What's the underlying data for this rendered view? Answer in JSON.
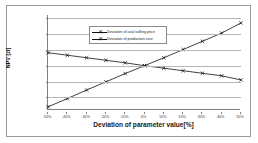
{
  "chart_data": {
    "type": "line",
    "title": "",
    "xlabel": "Deviation of parameter value[%]",
    "ylabel": "NPV [zł]",
    "x": [
      -50,
      -40,
      -30,
      -20,
      -10,
      0,
      10,
      20,
      30,
      40,
      50
    ],
    "xtick_labels": [
      "-50%",
      "-40%",
      "-30%",
      "-20%",
      "-10%",
      "0%",
      "10%",
      "20%",
      "30%",
      "40%",
      "50%"
    ],
    "ytick_labels": [
      "30 000 000",
      "25 000 000",
      "20 000 000",
      "15 000 000",
      "10 000 000",
      "5 000 000"
    ],
    "ytick_values": [
      30000000,
      25000000,
      20000000,
      15000000,
      10000000,
      5000000
    ],
    "ylim": [
      1000000,
      31000000
    ],
    "xlim": [
      -50,
      50
    ],
    "grid": "horizontal",
    "legend_position": "top-center",
    "series": [
      {
        "name": "Deviation of coal selling price",
        "marker": "x",
        "color": "#111111",
        "values": [
          2000000,
          4600000,
          7300000,
          9900000,
          12500000,
          15000000,
          17500000,
          20100000,
          22700000,
          25300000,
          28500000
        ]
      },
      {
        "name": "Deviation of production cost",
        "marker": "x",
        "color": "#111111",
        "values": [
          19100000,
          18300000,
          17500000,
          16700000,
          15900000,
          15000000,
          14200000,
          13400000,
          12600000,
          11800000,
          10500000
        ]
      }
    ]
  }
}
